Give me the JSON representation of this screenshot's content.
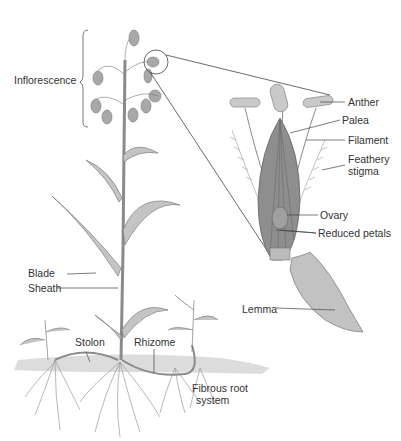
{
  "diagram": {
    "colors": {
      "background": "#ffffff",
      "plant_fill": "#bdbdbd",
      "plant_stroke": "#7a7a7a",
      "flower_fill": "#9a9a9a",
      "soil": "#d6d6d6",
      "label_text": "#333333",
      "leader_line": "#444444"
    },
    "labels": {
      "inflorescence": "Inflorescence",
      "anther": "Anther",
      "palea": "Palea",
      "filament": "Filament",
      "feathery_stigma_1": "Feathery",
      "feathery_stigma_2": "stigma",
      "ovary": "Ovary",
      "reduced_petals": "Reduced petals",
      "blade": "Blade",
      "sheath": "Sheath",
      "lemma": "Lemma",
      "stolon": "Stolon",
      "rhizome": "Rhizome",
      "fibrous_root_1": "Fibrous root",
      "fibrous_root_2": "system"
    }
  }
}
